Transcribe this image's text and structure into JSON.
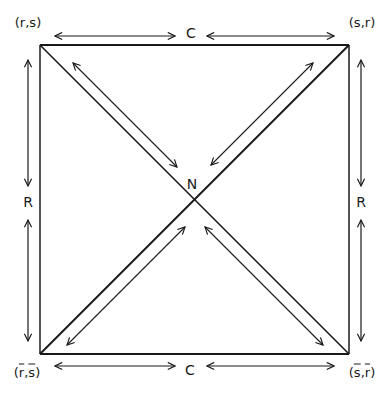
{
  "diagram": {
    "type": "square-relation-diagram",
    "colors": {
      "line": "#1a1a1a",
      "background": "#ffffff"
    },
    "corners": {
      "top_left": {
        "label": "(r,s)",
        "parts": [
          "r",
          "s"
        ],
        "overline": false
      },
      "top_right": {
        "label": "(s,r)",
        "parts": [
          "s",
          "r"
        ],
        "overline": false
      },
      "bottom_left": {
        "label": "(r̄,s̄)",
        "parts": [
          "r",
          "s"
        ],
        "overline": true
      },
      "bottom_right": {
        "label": "(s̄,r̄)",
        "parts": [
          "s",
          "r"
        ],
        "overline": true
      }
    },
    "center": {
      "label": "N"
    },
    "edges": {
      "top": {
        "label": "C"
      },
      "bottom": {
        "label": "C"
      },
      "left": {
        "label": "R"
      },
      "right": {
        "label": "R"
      }
    },
    "relations": [
      {
        "from": "top_left",
        "to": "top_right",
        "via": "C",
        "arrows": "both"
      },
      {
        "from": "bottom_left",
        "to": "bottom_right",
        "via": "C",
        "arrows": "both"
      },
      {
        "from": "top_left",
        "to": "bottom_left",
        "via": "R",
        "arrows": "both"
      },
      {
        "from": "top_right",
        "to": "bottom_right",
        "via": "R",
        "arrows": "both"
      },
      {
        "from": "top_left",
        "to": "bottom_right",
        "via": "N",
        "arrows": "both"
      },
      {
        "from": "top_right",
        "to": "bottom_left",
        "via": "N",
        "arrows": "both"
      }
    ]
  }
}
